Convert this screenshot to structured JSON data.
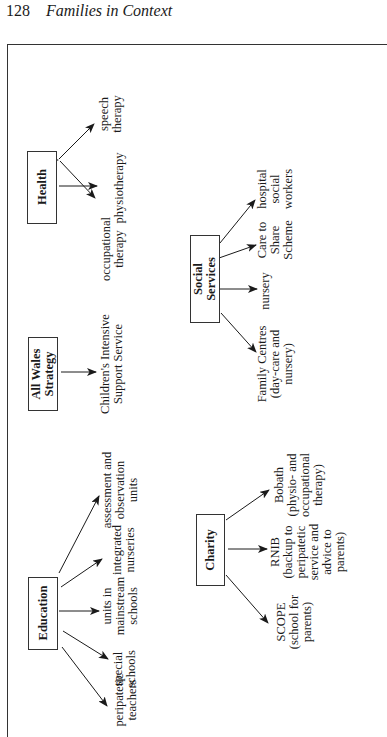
{
  "header": {
    "page_number": "128",
    "running_title": "Families in Context"
  },
  "diagram": {
    "nodes": [
      {
        "id": "health",
        "label": [
          "Health"
        ],
        "children": [
          [
            "occupational",
            "therapy"
          ],
          [
            "physiotherapy"
          ],
          [
            "speech",
            "therapy"
          ]
        ]
      },
      {
        "id": "all-wales-strategy",
        "label": [
          "All Wales",
          "Strategy"
        ],
        "children": [
          [
            "Children's Intensive",
            "Support Service"
          ]
        ]
      },
      {
        "id": "social-services",
        "label": [
          "Social",
          "Services"
        ],
        "children": [
          [
            "Family Centres",
            "(day-care and",
            "nursery)"
          ],
          [
            "nursery"
          ],
          [
            "Care to",
            "Share",
            "Scheme"
          ],
          [
            "hospital",
            "social",
            "workers"
          ]
        ]
      },
      {
        "id": "education",
        "label": [
          "Education"
        ],
        "children": [
          [
            "peripatetic",
            "teachers"
          ],
          [
            "special",
            "schools"
          ],
          [
            "units in",
            "mainstream",
            "schools"
          ],
          [
            "integrated",
            "nurseries"
          ],
          [
            "assessment and",
            "observation",
            "units"
          ]
        ]
      },
      {
        "id": "charity",
        "label": [
          "Charity"
        ],
        "children": [
          [
            "SCOPE",
            "(school for",
            "parents)"
          ],
          [
            "RNIB",
            "(backup to",
            "peripatetic",
            "service and",
            "advice to",
            "parents)"
          ],
          [
            "Bobath",
            "(physio- and",
            "occupational",
            "therapy)"
          ]
        ]
      }
    ]
  },
  "colors": {
    "ink": "#1a1a1a",
    "frame": "#333333",
    "background": "#ffffff"
  }
}
